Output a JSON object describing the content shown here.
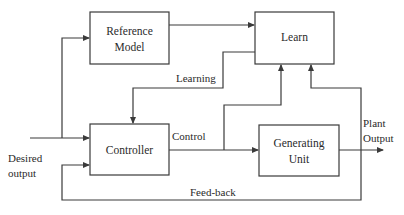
{
  "diagram": {
    "blocks": {
      "reference_model": {
        "line1": "Reference",
        "line2": "Model"
      },
      "learn": {
        "label": "Learn"
      },
      "controller": {
        "label": "Controller"
      },
      "generating_unit": {
        "line1": "Generating",
        "line2": "Unit"
      }
    },
    "signals": {
      "learning": "Learning",
      "control": "Control",
      "feedback": "Feed-back",
      "desired_output_line1": "Desired",
      "desired_output_line2": "output",
      "plant_output_line1": "Plant",
      "plant_output_line2": "Output"
    },
    "colors": {
      "stroke": "#3a3a3a",
      "text": "#2a2a2a",
      "background": "#ffffff"
    }
  }
}
